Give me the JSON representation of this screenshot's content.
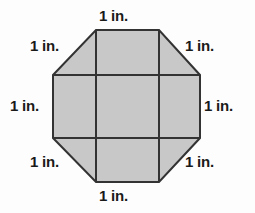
{
  "figure": {
    "background_color": "#fdfdfd",
    "shape": {
      "name": "octagon",
      "fill_color": "#c8c8c8",
      "stroke_color": "#333333",
      "stroke_width": 2,
      "vertices": [
        [
          53,
          75
        ],
        [
          96,
          30
        ],
        [
          159,
          30
        ],
        [
          200,
          75
        ],
        [
          200,
          138
        ],
        [
          159,
          182
        ],
        [
          96,
          182
        ],
        [
          53,
          138
        ]
      ]
    },
    "grid_lines": {
      "stroke_color": "#333333",
      "stroke_width": 2,
      "vertical_x": [
        96,
        159
      ],
      "horizontal_y": [
        75,
        138
      ]
    },
    "labels": {
      "top": "1 in.",
      "top_left": "1 in.",
      "top_right": "1 in.",
      "left": "1 in.",
      "right": "1 in.",
      "bottom_left": "1 in.",
      "bottom_right": "1 in.",
      "bottom": "1 in."
    }
  }
}
